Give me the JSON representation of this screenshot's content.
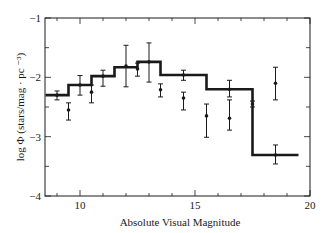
{
  "chart_data": {
    "type": "line",
    "subtype": "step-histogram-with-errorbars",
    "title": "",
    "xlabel": "Absolute Visual Magnitude",
    "ylabel": "log Φ (stars/mag · pc ⁻³)",
    "xlim": [
      8.5,
      20
    ],
    "ylim": [
      -4,
      -1
    ],
    "x_ticks": [
      10,
      15,
      20
    ],
    "x_minor_step": 1,
    "y_ticks": [
      -1,
      -2,
      -3,
      -4
    ],
    "y_tick_labels": [
      "−1",
      "−2",
      "−3",
      "−4"
    ],
    "y_minor_step": 0.5,
    "grid": false,
    "legend": null,
    "series": [
      {
        "name": "step function",
        "style": "thick-step",
        "bin_edges": [
          8.5,
          9.5,
          10.5,
          11.5,
          12.5,
          13.5,
          15.5,
          17.5,
          19.5
        ],
        "values": [
          -2.3,
          -2.13,
          -1.98,
          -1.83,
          -1.74,
          -1.96,
          -2.2,
          -3.31
        ]
      },
      {
        "name": "data points",
        "style": "points-with-errorbars",
        "points": [
          {
            "x": 9.0,
            "y": -2.3,
            "lo": -2.38,
            "hi": -2.23
          },
          {
            "x": 9.5,
            "y": -2.55,
            "lo": -2.72,
            "hi": -2.43
          },
          {
            "x": 10.0,
            "y": -2.13,
            "lo": -2.3,
            "hi": -1.97
          },
          {
            "x": 10.5,
            "y": -2.25,
            "lo": -2.43,
            "hi": -2.13
          },
          {
            "x": 11.0,
            "y": -1.98,
            "lo": -2.15,
            "hi": -1.88
          },
          {
            "x": 12.0,
            "y": -1.81,
            "lo": -2.16,
            "hi": -1.46
          },
          {
            "x": 12.5,
            "y": -1.86,
            "lo": -1.98,
            "hi": -1.76
          },
          {
            "x": 13.0,
            "y": -1.74,
            "lo": -2.08,
            "hi": -1.42
          },
          {
            "x": 13.5,
            "y": -2.21,
            "lo": -2.33,
            "hi": -2.11
          },
          {
            "x": 14.5,
            "y": -1.96,
            "lo": -2.05,
            "hi": -1.88
          },
          {
            "x": 14.5,
            "y": -2.35,
            "lo": -2.55,
            "hi": -2.25
          },
          {
            "x": 15.5,
            "y": -2.65,
            "lo": -3.01,
            "hi": -2.45
          },
          {
            "x": 16.5,
            "y": -2.2,
            "lo": -2.33,
            "hi": -2.05
          },
          {
            "x": 16.5,
            "y": -2.69,
            "lo": -2.89,
            "hi": -2.38
          },
          {
            "x": 17.5,
            "y": -2.45,
            "lo": -2.5,
            "hi": -2.4
          },
          {
            "x": 18.5,
            "y": -2.1,
            "lo": -2.38,
            "hi": -1.83
          },
          {
            "x": 18.5,
            "y": -3.31,
            "lo": -3.46,
            "hi": -3.14
          }
        ]
      }
    ]
  },
  "axes": {
    "x_label": "Absolute Visual Magnitude",
    "y_label": "log Φ (stars/mag · pc ⁻³)"
  },
  "colors": {
    "ink": "#1a1a1a",
    "background": "#ffffff"
  }
}
